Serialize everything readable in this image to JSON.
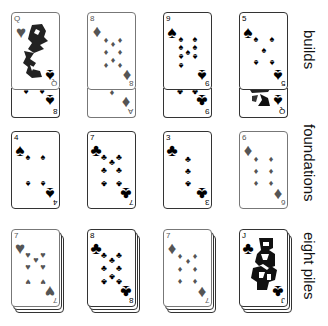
{
  "colors": {
    "black_suit": "#000000",
    "red_suit_rendered": "#555555",
    "card_border": "#333333",
    "background": "#ffffff"
  },
  "rows": [
    {
      "label": "builds",
      "cards": [
        {
          "rank": "Q",
          "suit": "hearts",
          "glyph": "♥",
          "under": {
            "rank": "8",
            "suit": "spades",
            "glyph": "♠"
          }
        },
        {
          "rank": "8",
          "suit": "diamonds",
          "glyph": "♦",
          "under": {
            "rank": "A",
            "suit": "diamonds",
            "glyph": "♦"
          }
        },
        {
          "rank": "9",
          "suit": "spades",
          "glyph": "♠",
          "under": {
            "rank": "9",
            "suit": "clubs",
            "glyph": "♣"
          }
        },
        {
          "rank": "5",
          "suit": "spades",
          "glyph": "♠",
          "under": {
            "rank": "Q",
            "suit": "spades",
            "glyph": "♠"
          }
        }
      ]
    },
    {
      "label": "foundations",
      "cards": [
        {
          "rank": "4",
          "suit": "spades",
          "glyph": "♠"
        },
        {
          "rank": "7",
          "suit": "clubs",
          "glyph": "♣"
        },
        {
          "rank": "3",
          "suit": "clubs",
          "glyph": "♣"
        },
        {
          "rank": "6",
          "suit": "diamonds",
          "glyph": "♦"
        }
      ]
    },
    {
      "label": "eight piles",
      "cards": [
        {
          "rank": "7",
          "suit": "hearts",
          "glyph": "♥"
        },
        {
          "rank": "8",
          "suit": "clubs",
          "glyph": "♣"
        },
        {
          "rank": "7",
          "suit": "diamonds",
          "glyph": "♦"
        },
        {
          "rank": "J",
          "suit": "clubs",
          "glyph": "♣"
        }
      ]
    }
  ]
}
